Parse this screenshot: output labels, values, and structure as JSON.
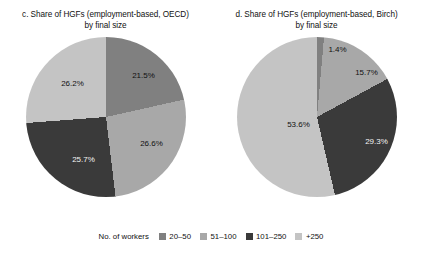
{
  "chart_data": [
    {
      "type": "pie",
      "title": "c. Share of HGFs (employment-based, OECD)",
      "subtitle": "by final size",
      "categories": [
        "20–50",
        "51–100",
        "101–250",
        "+250"
      ],
      "values": [
        21.5,
        26.6,
        25.7,
        26.2
      ],
      "labels": [
        "21.5%",
        "26.6%",
        "25.7%",
        "26.2%"
      ],
      "colors": [
        "#808080",
        "#a8a8a8",
        "#3a3a3a",
        "#c4c4c4"
      ],
      "label_colors": [
        "dark",
        "dark",
        "light",
        "dark"
      ],
      "start_angle_deg": 0,
      "direction": "clockwise",
      "legend_position": "bottom"
    },
    {
      "type": "pie",
      "title": "d. Share of HGFs (employment-based, Birch)",
      "subtitle": "by final size",
      "categories": [
        "20–50",
        "51–100",
        "101–250",
        "+250"
      ],
      "values": [
        1.4,
        15.7,
        29.3,
        53.6
      ],
      "labels": [
        "1.4%",
        "15.7%",
        "29.3%",
        "53.6%"
      ],
      "colors": [
        "#808080",
        "#a8a8a8",
        "#3a3a3a",
        "#c4c4c4"
      ],
      "label_colors": [
        "dark",
        "dark",
        "light",
        "dark"
      ],
      "start_angle_deg": 0,
      "direction": "clockwise",
      "legend_position": "bottom"
    }
  ],
  "panels": [
    {
      "title_line1": "c. Share of HGFs (employment-based, OECD)",
      "title_line2": "by final size",
      "slice_labels": [
        {
          "text": "21.5%",
          "x": 118,
          "y": 38
        },
        {
          "text": "26.6%",
          "x": 126,
          "y": 106
        },
        {
          "text": "25.7%",
          "x": 58,
          "y": 122
        },
        {
          "text": "26.2%",
          "x": 47,
          "y": 46
        }
      ]
    },
    {
      "title_line1": "d. Share of HGFs (employment-based, Birch)",
      "title_line2": "by final size",
      "slice_labels": [
        {
          "text": "1.4%",
          "x": 101,
          "y": 12
        },
        {
          "text": "15.7%",
          "x": 130,
          "y": 35
        },
        {
          "text": "29.3%",
          "x": 140,
          "y": 104
        },
        {
          "text": "53.6%",
          "x": 62,
          "y": 87
        }
      ]
    }
  ],
  "legend": {
    "title": "No. of workers",
    "items": [
      {
        "label": "20–50",
        "color": "#808080"
      },
      {
        "label": "51–100",
        "color": "#a8a8a8"
      },
      {
        "label": "101–250",
        "color": "#3a3a3a"
      },
      {
        "label": "+250",
        "color": "#c4c4c4"
      }
    ]
  }
}
